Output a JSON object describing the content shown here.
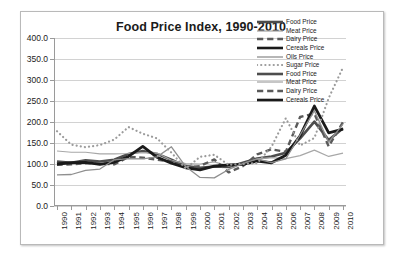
{
  "chart_data": {
    "type": "line",
    "title": "Food Price Index, 1990-2010",
    "xlabel": "",
    "ylabel": "",
    "ylim": [
      0,
      400
    ],
    "ytick_step": 50,
    "grid": true,
    "legend_position": "top-right",
    "x": [
      1990,
      1991,
      1992,
      1993,
      1994,
      1995,
      1996,
      1997,
      1998,
      1999,
      2000,
      2001,
      2002,
      2003,
      2004,
      2005,
      2006,
      2007,
      2008,
      2009,
      2010
    ],
    "ytick_labels": [
      "0.0",
      "50.0",
      "100.0",
      "150.0",
      "200.0",
      "250.0",
      "300.0",
      "350.0",
      "400.0"
    ],
    "xtick_labels": [
      "1990",
      "1991",
      "1992",
      "1993",
      "1994",
      "1995",
      "1996",
      "1997",
      "1998",
      "1999",
      "2000",
      "2001",
      "2002",
      "2003",
      "2004",
      "2005",
      "2006",
      "2007",
      "2008",
      "2009",
      "2010"
    ],
    "series": [
      {
        "name": "Food Price",
        "style": "thick-solid",
        "color": "#4d4d4d",
        "width": 2.6,
        "values": [
          106.0,
          103.0,
          109.0,
          106.0,
          110.0,
          124.0,
          131.0,
          124.0,
          110.0,
          95.0,
          91.0,
          94.0,
          93.0,
          103.0,
          113.0,
          118.0,
          127.0,
          161.0,
          201.0,
          157.0,
          185.0
        ]
      },
      {
        "name": "Meat Price",
        "style": "thin-solid",
        "color": "#a8a8a8",
        "width": 1.2,
        "values": [
          131.0,
          128.0,
          128.0,
          124.0,
          124.0,
          125.0,
          127.0,
          126.0,
          109.0,
          101.0,
          100.0,
          105.0,
          95.0,
          101.0,
          112.0,
          115.0,
          113.0,
          120.0,
          133.0,
          118.0,
          126.0
        ]
      },
      {
        "name": "Dairy Price",
        "style": "dashed",
        "color": "#5a5a5a",
        "width": 2.4,
        "values": [
          98.0,
          99.0,
          102.0,
          101.0,
          99.0,
          117.0,
          115.0,
          110.0,
          106.0,
          92.0,
          95.0,
          111.0,
          80.0,
          95.0,
          123.0,
          135.0,
          129.0,
          212.0,
          220.0,
          142.0,
          200.0
        ]
      },
      {
        "name": "Cereals Price",
        "style": "thick-solid",
        "color": "#1a1a1a",
        "width": 2.8,
        "values": [
          100.0,
          103.0,
          104.0,
          99.0,
          104.0,
          118.0,
          142.0,
          116.0,
          102.0,
          91.0,
          86.0,
          95.0,
          98.0,
          99.0,
          107.0,
          103.0,
          121.0,
          167.0,
          238.0,
          174.0,
          183.0
        ]
      },
      {
        "name": "Oils Price",
        "style": "thin-solid",
        "color": "#8f8f8f",
        "width": 1.3,
        "values": [
          74.0,
          75.0,
          85.0,
          88.0,
          110.0,
          113.0,
          112.0,
          117.0,
          141.0,
          94.0,
          68.0,
          67.0,
          87.0,
          101.0,
          112.0,
          103.0,
          112.0,
          169.0,
          227.0,
          152.0,
          195.0
        ]
      },
      {
        "name": "Sugar Price",
        "style": "dotted",
        "color": "#9b9b9b",
        "width": 2.2,
        "values": [
          178.0,
          146.0,
          140.0,
          145.0,
          158.0,
          188.0,
          172.0,
          161.0,
          127.0,
          89.0,
          117.0,
          122.0,
          98.0,
          100.0,
          102.0,
          141.0,
          209.0,
          144.0,
          162.0,
          257.0,
          330.0
        ]
      }
    ],
    "legend_entries": [
      {
        "label": "Food Price",
        "style": "thick-solid",
        "color": "#4d4d4d"
      },
      {
        "label": "Meat Price",
        "style": "thin-solid",
        "color": "#a8a8a8"
      },
      {
        "label": "Dairy Price",
        "style": "dashed",
        "color": "#5a5a5a"
      },
      {
        "label": "Cereals Price",
        "style": "thick-solid",
        "color": "#1a1a1a"
      },
      {
        "label": "Oils Price",
        "style": "thin-solid",
        "color": "#8f8f8f"
      },
      {
        "label": "Sugar Price",
        "style": "dotted",
        "color": "#9b9b9b"
      },
      {
        "label": "Food Price",
        "style": "thick-solid",
        "color": "#4d4d4d"
      },
      {
        "label": "Meat Price",
        "style": "thin-solid",
        "color": "#a8a8a8"
      },
      {
        "label": "Dairy Price",
        "style": "dashed",
        "color": "#5a5a5a"
      },
      {
        "label": "Cereals Price",
        "style": "thick-solid",
        "color": "#1a1a1a"
      }
    ]
  }
}
